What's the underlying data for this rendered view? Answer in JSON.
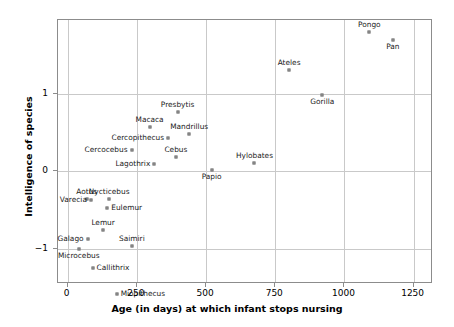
{
  "chart_data": {
    "type": "scatter",
    "title": "",
    "xlabel": "Age (in days) at which infant stops nursing",
    "ylabel": "Intelligence of species",
    "xlim": [
      -35,
      1320
    ],
    "ylim": [
      -1.45,
      1.95
    ],
    "xticks": [
      0,
      250,
      500,
      750,
      1000,
      1250
    ],
    "xticklabels": [
      "0",
      "250",
      "500",
      "750",
      "1000",
      "1250"
    ],
    "yticks": [
      -1,
      0,
      1
    ],
    "yticklabels": [
      "−1",
      "0",
      "1"
    ],
    "grid": true,
    "legend": "none",
    "marker_color": "#9a9a9a",
    "grid_color": "#c9c9c9",
    "frame_color": "#8c8c8c",
    "points": [
      {
        "label": "Pongo",
        "x": 1090,
        "y": 1.79,
        "pos": "above"
      },
      {
        "label": "Pan",
        "x": 1175,
        "y": 1.69,
        "pos": "below"
      },
      {
        "label": "Ateles",
        "x": 800,
        "y": 1.3,
        "pos": "above"
      },
      {
        "label": "Gorilla",
        "x": 920,
        "y": 0.98,
        "pos": "below"
      },
      {
        "label": "Presbytis",
        "x": 397,
        "y": 0.77,
        "pos": "above"
      },
      {
        "label": "Macaca",
        "x": 296,
        "y": 0.57,
        "pos": "above"
      },
      {
        "label": "Mandrillus",
        "x": 439,
        "y": 0.48,
        "pos": "above"
      },
      {
        "label": "Cercopithecus",
        "x": 363,
        "y": 0.43,
        "pos": "left"
      },
      {
        "label": "Cercocebus",
        "x": 231,
        "y": 0.27,
        "pos": "left"
      },
      {
        "label": "Cebus",
        "x": 391,
        "y": 0.19,
        "pos": "above"
      },
      {
        "label": "Lagothrix",
        "x": 313,
        "y": 0.1,
        "pos": "left"
      },
      {
        "label": "Hylobates",
        "x": 675,
        "y": 0.11,
        "pos": "above"
      },
      {
        "label": "Papio",
        "x": 520,
        "y": 0.02,
        "pos": "below"
      },
      {
        "label": "Aotus",
        "x": 69,
        "y": -0.36,
        "pos": "above"
      },
      {
        "label": "Nycticebus",
        "x": 150,
        "y": -0.36,
        "pos": "above"
      },
      {
        "label": "Varecia",
        "x": 84,
        "y": -0.37,
        "pos": "left"
      },
      {
        "label": "Eulemur",
        "x": 143,
        "y": -0.47,
        "pos": "right"
      },
      {
        "label": "Lemur",
        "x": 128,
        "y": -0.76,
        "pos": "above"
      },
      {
        "label": "Galago",
        "x": 72,
        "y": -0.87,
        "pos": "left"
      },
      {
        "label": "Saimiri",
        "x": 232,
        "y": -0.96,
        "pos": "above"
      },
      {
        "label": "Microcebus",
        "x": 40,
        "y": -1.0,
        "pos": "below"
      },
      {
        "label": "Callithrix",
        "x": 90,
        "y": -1.25,
        "pos": "right"
      },
      {
        "label": "Miopithecus",
        "x": 177,
        "y": -1.58,
        "pos": "right"
      }
    ]
  }
}
